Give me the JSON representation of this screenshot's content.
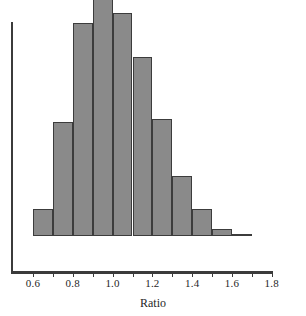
{
  "chart_data": {
    "type": "bar",
    "subtype": "histogram",
    "title": "",
    "subtitle": "",
    "xlabel": "Ratio",
    "ylabel": "",
    "grid": false,
    "legend": null,
    "legend_position": "none",
    "xlim": [
      0.5,
      1.8
    ],
    "ylim": [
      0,
      100
    ],
    "xticks": [
      "0.6",
      "0.8",
      "1.0",
      "1.2",
      "1.4",
      "1.6",
      "1.8"
    ],
    "xtick_values": [
      0.6,
      0.8,
      1.0,
      1.2,
      1.4,
      1.6,
      1.8
    ],
    "yticks": [],
    "bin_width": 0.1,
    "bin_edges": [
      0.6,
      0.7,
      0.8,
      0.9,
      1.0,
      1.1,
      1.2,
      1.3,
      1.4,
      1.5,
      1.6,
      1.7
    ],
    "categories": [
      "0.6-0.7",
      "0.7-0.8",
      "0.8-0.9",
      "0.9-1.0",
      "1.0-1.1",
      "1.1-1.2",
      "1.2-1.3",
      "1.3-1.4",
      "1.4-1.5",
      "1.5-1.6",
      "1.6-1.7"
    ],
    "values": [
      11,
      46,
      86,
      100,
      90,
      72,
      47,
      24,
      11,
      3,
      1
    ],
    "bars": [
      {
        "bin_start": 0.6,
        "bin_end": 0.7,
        "value": 11
      },
      {
        "bin_start": 0.7,
        "bin_end": 0.8,
        "value": 46
      },
      {
        "bin_start": 0.8,
        "bin_end": 0.9,
        "value": 86
      },
      {
        "bin_start": 0.9,
        "bin_end": 1.0,
        "value": 100
      },
      {
        "bin_start": 1.0,
        "bin_end": 1.1,
        "value": 90
      },
      {
        "bin_start": 1.1,
        "bin_end": 1.2,
        "value": 72
      },
      {
        "bin_start": 1.2,
        "bin_end": 1.3,
        "value": 47
      },
      {
        "bin_start": 1.3,
        "bin_end": 1.4,
        "value": 24
      },
      {
        "bin_start": 1.4,
        "bin_end": 1.5,
        "value": 11
      },
      {
        "bin_start": 1.5,
        "bin_end": 1.6,
        "value": 3
      },
      {
        "bin_start": 1.6,
        "bin_end": 1.7,
        "value": 1
      }
    ],
    "colors": {
      "bar_fill": "#8a8a8a",
      "bar_edge": "#3c3c3c",
      "axis": "#3b3b3b",
      "text": "#1f1f1f",
      "background": "#ffffff"
    }
  },
  "axis": {
    "x_title": "Ratio"
  }
}
